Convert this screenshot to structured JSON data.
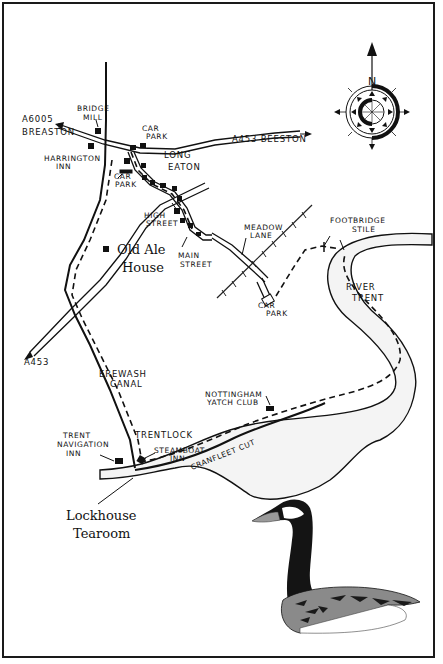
{
  "map": {
    "title": "Long Eaton to Trentlock walk map",
    "compass": {
      "north_label": "N"
    },
    "roads": {
      "a6005_label": "A6005",
      "breaston_label": "BREASTON",
      "a453_beeston_label": "A453 BEESTON",
      "a453_label": "A453"
    },
    "places": {
      "bridge_mill": [
        "BRIDGE",
        "MILL"
      ],
      "harrington_inn": [
        "HARRINGTON",
        "INN"
      ],
      "car_park_top": [
        "CAR",
        "PARK"
      ],
      "car_park_left": [
        "CAR",
        "PARK"
      ],
      "long_eaton": [
        "LONG",
        "EATON"
      ],
      "high_street": [
        "HIGH",
        "STREET"
      ],
      "main_street": [
        "MAIN",
        "STREET"
      ],
      "old_ale_house": [
        "Old Ale",
        "House"
      ],
      "meadow_lane": [
        "MEADOW",
        "LANE"
      ],
      "car_park_meadow": [
        "CAR",
        "PARK"
      ],
      "footbridge_stile": [
        "FOOTBRIDGE",
        "STILE"
      ],
      "river_trent": [
        "RIVER",
        "TRENT"
      ],
      "erewash_canal": [
        "EREWASH",
        "CANAL"
      ],
      "nottingham_yacht_club": [
        "NOTTINGHAM",
        "YATCH CLUB"
      ],
      "trentlock": "TRENTLOCK",
      "trent_navigation_inn": [
        "TRENT",
        "NAVIGATION",
        "INN"
      ],
      "steamboat_inn": [
        "STEAMBOAT",
        "INN"
      ],
      "cranfleet_cut": "CRANFLEET CUT",
      "lockhouse_tearoom": [
        "Lockhouse",
        "Tearoom"
      ]
    },
    "illustration": "canada-goose",
    "colors": {
      "ink": "#111111",
      "background": "#ffffff",
      "river_fill": "#f4f4f4",
      "goose_wing": "#8a8a8a"
    }
  }
}
